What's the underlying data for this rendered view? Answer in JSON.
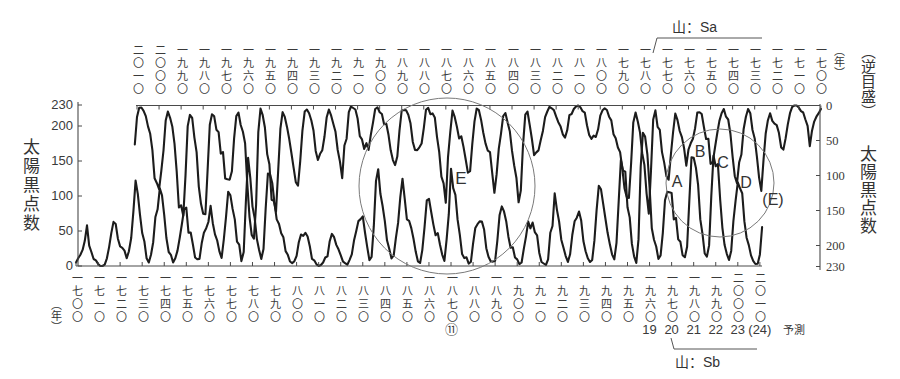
{
  "chart_data": {
    "type": "line",
    "title": "",
    "grid": false,
    "legend": null,
    "ylim": [
      0,
      230
    ],
    "x_years": {
      "start": 1700,
      "end": 2011,
      "step": 1
    },
    "axes": {
      "left": {
        "label": "太陽黒点数",
        "ticks": [
          0,
          50,
          100,
          150,
          200,
          230
        ],
        "direction": "normal"
      },
      "right": {
        "label_prefix": "（逆目盛）",
        "label": "太陽黒点数",
        "ticks": [
          0,
          50,
          100,
          150,
          200,
          230
        ],
        "direction": "reversed"
      },
      "bottom": {
        "unit_label": "（年）",
        "direction": "normal",
        "ticks": [
          1700,
          1710,
          1720,
          1730,
          1740,
          1750,
          1760,
          1770,
          1780,
          1790,
          1800,
          1810,
          1820,
          1830,
          1840,
          1850,
          1860,
          1870,
          1880,
          1890,
          1900,
          1910,
          1920,
          1930,
          1940,
          1950,
          1960,
          1970,
          1980,
          1990,
          2000,
          2010
        ],
        "tick_labels": [
          "一七〇〇",
          "一七一〇",
          "一七二〇",
          "一七三〇",
          "一七四〇",
          "一七五〇",
          "一七六〇",
          "一七七〇",
          "一七八〇",
          "一七九〇",
          "一八〇〇",
          "一八一〇",
          "一八二〇",
          "一八三〇",
          "一八四〇",
          "一八五〇",
          "一八六〇",
          "一八七〇",
          "一八八〇",
          "一八九〇",
          "一九〇〇",
          "一九一〇",
          "一九二〇",
          "一九三〇",
          "一九四〇",
          "一九五〇",
          "一九六〇",
          "一九七〇",
          "一九八〇",
          "一九九〇",
          "二〇〇〇",
          "二〇一〇"
        ]
      },
      "top": {
        "unit_label": "（年）",
        "direction": "reversed",
        "ticks": [
          2010,
          2000,
          1990,
          1980,
          1970,
          1960,
          1950,
          1940,
          1930,
          1920,
          1910,
          1900,
          1890,
          1880,
          1870,
          1860,
          1850,
          1840,
          1830,
          1820,
          1810,
          1800,
          1790,
          1780,
          1770,
          1760,
          1750,
          1740,
          1730,
          1720,
          1710,
          1700
        ],
        "tick_labels": [
          "二〇一〇",
          "二〇〇〇",
          "一九九〇",
          "一九八〇",
          "一九七〇",
          "一九六〇",
          "一九五〇",
          "一九四〇",
          "一九三〇",
          "一九二〇",
          "一九一〇",
          "一九〇〇",
          "一八九〇",
          "一八八〇",
          "一八七〇",
          "一八六〇",
          "一八五〇",
          "一八四〇",
          "一八三〇",
          "一八二〇",
          "一八一〇",
          "一八〇〇",
          "一七九〇",
          "一七八〇",
          "一七七〇",
          "一七六〇",
          "一七五〇",
          "一七四〇",
          "一七三〇",
          "一七二〇",
          "一七一〇",
          "一七〇〇"
        ]
      }
    },
    "series": [
      {
        "name": "太陽黒点数",
        "x_axis": "bottom",
        "y_axis": "left",
        "values": [
          5,
          11,
          16,
          23,
          36,
          58,
          29,
          20,
          10,
          8,
          3,
          0,
          0,
          2,
          11,
          27,
          47,
          63,
          60,
          39,
          28,
          26,
          22,
          11,
          21,
          40,
          78,
          122,
          103,
          73,
          47,
          35,
          11,
          5,
          16,
          34,
          70,
          81,
          111,
          101,
          73,
          40,
          20,
          16,
          5,
          11,
          22,
          40,
          60,
          80.9,
          83.4,
          47.7,
          47.8,
          30.7,
          12.2,
          9.6,
          10.2,
          32.4,
          47.6,
          54.0,
          62.9,
          85.9,
          61.2,
          45.1,
          36.4,
          20.9,
          11.4,
          37.8,
          69.8,
          106.1,
          100.8,
          81.6,
          66.5,
          34.8,
          30.6,
          7.0,
          19.8,
          92.5,
          154.4,
          125.9,
          84.8,
          68.1,
          38.5,
          22.8,
          10.2,
          24.1,
          82.9,
          132.0,
          130.9,
          118.1,
          89.9,
          66.6,
          60.0,
          46.9,
          41.0,
          21.3,
          16.0,
          6.4,
          4.1,
          6.8,
          14.5,
          34.0,
          45.0,
          43.1,
          47.5,
          42.2,
          28.1,
          10.1,
          8.1,
          2.5,
          0.0,
          1.4,
          5.0,
          12.2,
          13.9,
          35.4,
          45.8,
          41.1,
          30.1,
          23.9,
          15.6,
          6.6,
          4.0,
          1.8,
          8.5,
          16.6,
          36.3,
          49.6,
          64.2,
          67.0,
          70.9,
          47.8,
          27.5,
          8.5,
          13.2,
          56.9,
          121.5,
          138.3,
          103.2,
          85.7,
          64.6,
          36.7,
          24.2,
          10.7,
          15.0,
          40.1,
          61.5,
          98.5,
          124.7,
          96.3,
          66.6,
          64.5,
          54.1,
          39.0,
          20.6,
          6.7,
          4.3,
          22.7,
          54.8,
          93.8,
          95.8,
          77.2,
          59.1,
          44.0,
          47.0,
          30.5,
          16.3,
          7.3,
          37.6,
          74.0,
          139.0,
          111.2,
          101.6,
          66.2,
          44.7,
          17.0,
          11.3,
          12.4,
          3.4,
          6.0,
          32.3,
          54.3,
          59.7,
          63.7,
          63.5,
          52.2,
          25.4,
          13.1,
          6.8,
          6.3,
          7.1,
          35.6,
          73.0,
          85.1,
          78.0,
          64.0,
          41.8,
          26.2,
          26.7,
          12.1,
          9.5,
          2.7,
          5.0,
          24.4,
          42.0,
          63.5,
          53.8,
          62.0,
          48.5,
          43.9,
          18.6,
          5.7,
          3.6,
          1.4,
          9.6,
          47.4,
          57.1,
          103.9,
          80.6,
          63.6,
          37.6,
          26.1,
          14.2,
          5.8,
          16.7,
          44.3,
          63.9,
          69.0,
          77.8,
          64.9,
          35.7,
          21.2,
          11.1,
          5.7,
          8.7,
          36.1,
          79.7,
          114.4,
          109.6,
          88.8,
          67.8,
          47.5,
          30.6,
          16.3,
          9.6,
          33.2,
          92.6,
          151.6,
          136.3,
          134.7,
          83.9,
          69.4,
          31.5,
          13.9,
          4.4,
          38.0,
          141.7,
          190.2,
          184.8,
          159.0,
          112.3,
          53.9,
          37.6,
          27.9,
          10.2,
          15.1,
          47.0,
          93.8,
          105.9,
          105.5,
          104.5,
          66.6,
          68.9,
          38.0,
          34.5,
          15.5,
          12.6,
          27.5,
          92.5,
          155.4,
          154.6,
          140.4,
          115.9,
          66.6,
          45.9,
          17.9,
          13.4,
          29.4,
          100.2,
          157.6,
          142.6,
          145.7,
          94.3,
          54.6,
          29.9,
          17.5,
          8.6,
          21.5,
          64.3,
          93.3,
          119.6,
          111.0,
          104.0,
          63.7,
          40.4,
          29.8,
          15.2,
          7.5,
          2.9,
          3.1,
          16.5,
          55.7
        ]
      },
      {
        "name": "太陽黒点数（逆目盛・時間反転）",
        "x_axis": "top",
        "y_axis": "right",
        "values": [
          5,
          11,
          16,
          23,
          36,
          58,
          29,
          20,
          10,
          8,
          3,
          0,
          0,
          2,
          11,
          27,
          47,
          63,
          60,
          39,
          28,
          26,
          22,
          11,
          21,
          40,
          78,
          122,
          103,
          73,
          47,
          35,
          11,
          5,
          16,
          34,
          70,
          81,
          111,
          101,
          73,
          40,
          20,
          16,
          5,
          11,
          22,
          40,
          60,
          80.9,
          83.4,
          47.7,
          47.8,
          30.7,
          12.2,
          9.6,
          10.2,
          32.4,
          47.6,
          54.0,
          62.9,
          85.9,
          61.2,
          45.1,
          36.4,
          20.9,
          11.4,
          37.8,
          69.8,
          106.1,
          100.8,
          81.6,
          66.5,
          34.8,
          30.6,
          7.0,
          19.8,
          92.5,
          154.4,
          125.9,
          84.8,
          68.1,
          38.5,
          22.8,
          10.2,
          24.1,
          82.9,
          132.0,
          130.9,
          118.1,
          89.9,
          66.6,
          60.0,
          46.9,
          41.0,
          21.3,
          16.0,
          6.4,
          4.1,
          6.8,
          14.5,
          34.0,
          45.0,
          43.1,
          47.5,
          42.2,
          28.1,
          10.1,
          8.1,
          2.5,
          0.0,
          1.4,
          5.0,
          12.2,
          13.9,
          35.4,
          45.8,
          41.1,
          30.1,
          23.9,
          15.6,
          6.6,
          4.0,
          1.8,
          8.5,
          16.6,
          36.3,
          49.6,
          64.2,
          67.0,
          70.9,
          47.8,
          27.5,
          8.5,
          13.2,
          56.9,
          121.5,
          138.3,
          103.2,
          85.7,
          64.6,
          36.7,
          24.2,
          10.7,
          15.0,
          40.1,
          61.5,
          98.5,
          124.7,
          96.3,
          66.6,
          64.5,
          54.1,
          39.0,
          20.6,
          6.7,
          4.3,
          22.7,
          54.8,
          93.8,
          95.8,
          77.2,
          59.1,
          44.0,
          47.0,
          30.5,
          16.3,
          7.3,
          37.6,
          74.0,
          139.0,
          111.2,
          101.6,
          66.2,
          44.7,
          17.0,
          11.3,
          12.4,
          3.4,
          6.0,
          32.3,
          54.3,
          59.7,
          63.7,
          63.5,
          52.2,
          25.4,
          13.1,
          6.8,
          6.3,
          7.1,
          35.6,
          73.0,
          85.1,
          78.0,
          64.0,
          41.8,
          26.2,
          26.7,
          12.1,
          9.5,
          2.7,
          5.0,
          24.4,
          42.0,
          63.5,
          53.8,
          62.0,
          48.5,
          43.9,
          18.6,
          5.7,
          3.6,
          1.4,
          9.6,
          47.4,
          57.1,
          103.9,
          80.6,
          63.6,
          37.6,
          26.1,
          14.2,
          5.8,
          16.7,
          44.3,
          63.9,
          69.0,
          77.8,
          64.9,
          35.7,
          21.2,
          11.1,
          5.7,
          8.7,
          36.1,
          79.7,
          114.4,
          109.6,
          88.8,
          67.8,
          47.5,
          30.6,
          16.3,
          9.6,
          33.2,
          92.6,
          151.6,
          136.3,
          134.7,
          83.9,
          69.4,
          31.5,
          13.9,
          4.4,
          38.0,
          141.7,
          190.2,
          184.8,
          159.0,
          112.3,
          53.9,
          37.6,
          27.9,
          10.2,
          15.1,
          47.0,
          93.8,
          105.9,
          105.5,
          104.5,
          66.6,
          68.9,
          38.0,
          34.5,
          15.5,
          12.6,
          27.5,
          92.5,
          155.4,
          154.6,
          140.4,
          115.9,
          66.6,
          45.9,
          17.9,
          13.4,
          29.4,
          100.2,
          157.6,
          142.6,
          145.7,
          94.3,
          54.6,
          29.9,
          17.5,
          8.6,
          21.5,
          64.3,
          93.3,
          119.6,
          111.0,
          104.0,
          63.7,
          40.4,
          29.8,
          15.2,
          7.5,
          2.9,
          3.1,
          16.5,
          55.7
        ]
      }
    ],
    "cycle_labels": [
      {
        "year": 1870,
        "label": "⑪"
      },
      {
        "year": 1960,
        "label": "19"
      },
      {
        "year": 1970,
        "label": "20"
      },
      {
        "year": 1980,
        "label": "21"
      },
      {
        "year": 1990,
        "label": "22"
      },
      {
        "year": 2000,
        "label": "23"
      },
      {
        "year": 2010,
        "label": "(24)"
      }
    ],
    "forecast_label": "予測",
    "annotations": {
      "peak_sa": "山：Sa",
      "peak_sb": "山：Sb",
      "circle_e_label": "E",
      "small_circle_labels": [
        "A",
        "B",
        "C",
        "D"
      ],
      "small_circle_ref": "(E)"
    },
    "colors": {
      "line": "#1c1c1c",
      "axis": "#4a4a4a",
      "circle": "#7a7a7a",
      "text": "#333333"
    }
  }
}
